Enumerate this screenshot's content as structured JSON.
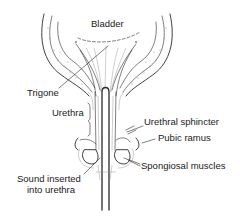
{
  "diagram": {
    "labels": {
      "bladder": "Bladder",
      "trigone": "Trigone",
      "urethra": "Urethra",
      "urethral_sphincter": "Urethral sphincter",
      "pubic_ramus": "Pubic ramus",
      "spongiosal_muscles": "Spongiosal muscles",
      "sound_line1": "Sound inserted",
      "sound_line2": "into urethra"
    },
    "colors": {
      "ink": "#2a2a2a",
      "background": "#ffffff",
      "stipple": "#8a8a8a"
    }
  }
}
